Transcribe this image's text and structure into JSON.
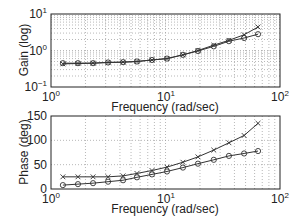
{
  "chart_data": [
    {
      "type": "line",
      "panel": "top",
      "title": "",
      "xlabel": "Frequency (rad/sec)",
      "ylabel": "Gain (log)",
      "xscale": "log",
      "yscale": "log",
      "xlim": [
        1,
        100
      ],
      "ylim": [
        0.1,
        10
      ],
      "xticks": [
        "10^0",
        "10^1",
        "10^2"
      ],
      "yticks": [
        "10^-1",
        "10^0",
        "10^1"
      ],
      "grid": true,
      "x": [
        1.27,
        1.72,
        2.33,
        3.15,
        4.26,
        5.63,
        7.62,
        10.3,
        14.2,
        19.2,
        26.4,
        35.8,
        48.6,
        64.3
      ],
      "series": [
        {
          "name": "x-marker series",
          "marker": "x",
          "values": [
            0.43,
            0.44,
            0.45,
            0.47,
            0.48,
            0.5,
            0.55,
            0.6,
            0.76,
            1.0,
            1.4,
            1.9,
            2.7,
            4.4
          ]
        },
        {
          "name": "o-marker series",
          "marker": "o",
          "values": [
            0.45,
            0.45,
            0.45,
            0.47,
            0.48,
            0.5,
            0.55,
            0.6,
            0.76,
            0.97,
            1.3,
            1.8,
            2.2,
            2.8
          ]
        }
      ]
    },
    {
      "type": "line",
      "panel": "bottom",
      "title": "",
      "xlabel": "Frequency (rad/sec)",
      "ylabel": "Phase (deg)",
      "xscale": "log",
      "yscale": "linear",
      "xlim": [
        1,
        100
      ],
      "ylim": [
        0,
        150
      ],
      "xticks": [
        "10^0",
        "10^1",
        "10^2"
      ],
      "yticks": [
        "0",
        "50",
        "100",
        "150"
      ],
      "grid": true,
      "x": [
        1.27,
        1.72,
        2.33,
        3.15,
        4.26,
        5.63,
        7.62,
        10.3,
        14.2,
        19.2,
        26.4,
        35.8,
        48.6,
        64.3
      ],
      "series": [
        {
          "name": "x-marker series",
          "marker": "x",
          "values": [
            25,
            25,
            25,
            25,
            27,
            32,
            38,
            45,
            55,
            66,
            80,
            95,
            110,
            135
          ]
        },
        {
          "name": "o-marker series",
          "marker": "o",
          "values": [
            8,
            10,
            12,
            15,
            18,
            24,
            30,
            36,
            44,
            52,
            60,
            68,
            73,
            78
          ]
        }
      ]
    }
  ],
  "labels": {
    "gain_ylabel": "Gain (log)",
    "phase_ylabel": "Phase (deg)",
    "xlabel": "Frequency (rad/sec)",
    "x_tick_base": "10",
    "x_tick_exps": [
      "0",
      "1",
      "2"
    ],
    "gain_tick_base": "10",
    "gain_tick_exps": [
      "1",
      "0",
      "−1"
    ],
    "phase_ticks": [
      "150",
      "100",
      "50",
      "0"
    ]
  },
  "colors": {
    "line": "#333333",
    "axis": "#222222",
    "grid": "#9a9a9a"
  }
}
